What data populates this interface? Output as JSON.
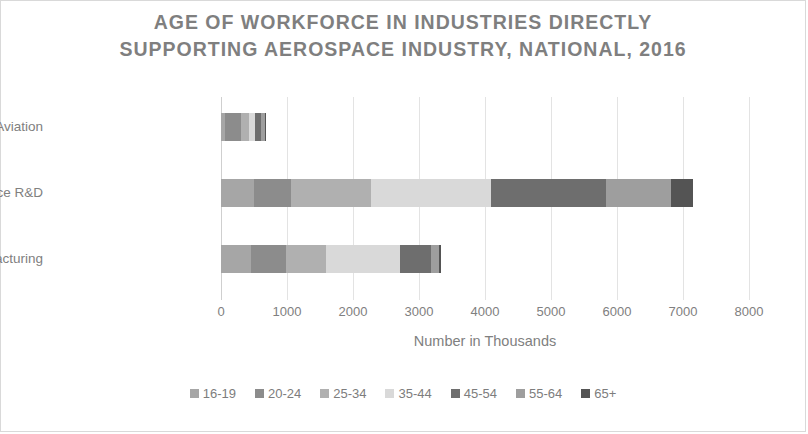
{
  "chart_data": {
    "type": "bar",
    "orientation": "horizontal",
    "stacked": true,
    "title": "AGE OF WORKFORCE IN INDUSTRIES DIRECTLY SUPPORTING AEROSPACE INDUSTRY, NATIONAL, 2016",
    "title_line1": "AGE OF WORKFORCE IN INDUSTRIES DIRECTLY",
    "title_line2": "SUPPORTING AEROSPACE INDUSTRY, NATIONAL, 2016",
    "xlabel": "Number in Thousands",
    "ylabel": "",
    "xlim": [
      0,
      8000
    ],
    "xticks": [
      0,
      1000,
      2000,
      3000,
      4000,
      5000,
      6000,
      7000,
      8000
    ],
    "xtick_labels": [
      "0",
      "1000",
      "2000",
      "3000",
      "4000",
      "5000",
      "6000",
      "7000",
      "8000"
    ],
    "grid": true,
    "legend_position": "bottom",
    "categories": [
      "Aviation",
      "Aerospace R&D",
      "Aerospace Manufacturing"
    ],
    "category_order_top_to_bottom": [
      "Aviation",
      "Aerospace R&D",
      "Aerospace Manufacturing"
    ],
    "series": [
      {
        "name": "16-19",
        "color": "#a6a6a6",
        "values": [
          60,
          500,
          450
        ]
      },
      {
        "name": "20-24",
        "color": "#8c8c8c",
        "values": [
          240,
          560,
          530
        ]
      },
      {
        "name": "25-34",
        "color": "#b0b0b0",
        "values": [
          120,
          1210,
          610
        ]
      },
      {
        "name": "35-44",
        "color": "#d9d9d9",
        "values": [
          90,
          1820,
          1120
        ]
      },
      {
        "name": "45-54",
        "color": "#6e6e6e",
        "values": [
          90,
          1740,
          480
        ]
      },
      {
        "name": "55-64",
        "color": "#9e9e9e",
        "values": [
          60,
          990,
          120
        ]
      },
      {
        "name": "65+",
        "color": "#545454",
        "values": [
          20,
          330,
          20
        ]
      }
    ],
    "totals": [
      680,
      7150,
      3330
    ]
  },
  "legend": {
    "items": [
      {
        "label": "16-19",
        "color": "#a6a6a6"
      },
      {
        "label": "20-24",
        "color": "#8c8c8c"
      },
      {
        "label": "25-34",
        "color": "#b0b0b0"
      },
      {
        "label": "35-44",
        "color": "#d9d9d9"
      },
      {
        "label": "45-54",
        "color": "#6e6e6e"
      },
      {
        "label": "55-64",
        "color": "#9e9e9e"
      },
      {
        "label": "65+",
        "color": "#545454"
      }
    ]
  },
  "colors": {
    "title_text": "#7f7f7f",
    "axis_text": "#808080",
    "gridline": "#e3e3e3",
    "border": "#d9d9d9",
    "background": "#ffffff"
  }
}
